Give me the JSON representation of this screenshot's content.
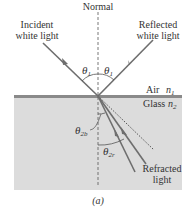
{
  "figure": {
    "labels": {
      "normal": "Normal",
      "incident_line1": "Incident",
      "incident_line2": "white light",
      "reflected_line1": "Reflected",
      "reflected_line2": "white light",
      "air": "Air",
      "air_index": "n",
      "air_index_sub": "1",
      "glass": "Glass",
      "glass_index": "n",
      "glass_index_sub": "2",
      "theta": "θ",
      "theta_incident_sub": "1",
      "theta_reflected_sub": "1",
      "theta_blue_sub": "2b",
      "theta_red_sub": "2r",
      "refracted_line1": "Refracted",
      "refracted_line2": "light",
      "caption": "(a)"
    },
    "colors": {
      "glass_fill": "#dcdcdc",
      "surface_line": "#8a8a8a",
      "ray": "#6e6e6e",
      "text": "#333333"
    }
  }
}
